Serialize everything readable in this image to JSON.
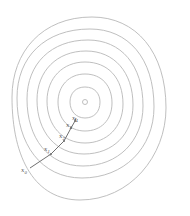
{
  "diagram": {
    "type": "contour-plot-gradient-descent",
    "center": {
      "x": 85,
      "y": 102
    },
    "contours": [
      {
        "rx": 3,
        "ry": 3
      },
      {
        "rx": 15,
        "ry": 15
      },
      {
        "rx": 27,
        "ry": 28
      },
      {
        "rx": 38,
        "ry": 40
      },
      {
        "rx": 48,
        "ry": 52
      },
      {
        "rx": 58,
        "ry": 63
      },
      {
        "rx": 68,
        "ry": 75
      },
      {
        "rx": 78,
        "ry": 86
      }
    ],
    "iterates": [
      {
        "label": "x",
        "sub": "0",
        "x": 30,
        "y": 168
      },
      {
        "label": "x",
        "sub": "1",
        "x": 51,
        "y": 154
      },
      {
        "label": "x",
        "sub": "2",
        "x": 64,
        "y": 140
      },
      {
        "label": "x",
        "sub": "3",
        "x": 71,
        "y": 127
      },
      {
        "label": "x",
        "sub": "4",
        "x": 75,
        "y": 120
      }
    ],
    "colors": {
      "contour": "#b8b8b8",
      "path": "#707070",
      "label": "#555555"
    }
  }
}
